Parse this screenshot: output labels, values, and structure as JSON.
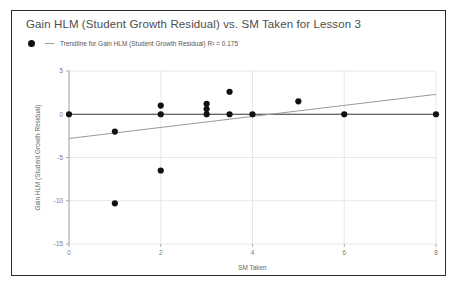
{
  "chart_data": {
    "type": "scatter",
    "title": "Gain HLM (Student Growth Residual) vs. SM Taken for Lesson 3",
    "xlabel": "SM Taken",
    "ylabel": "Gain HLM (Student Growth Residual)",
    "xlim": [
      0,
      8
    ],
    "ylim": [
      -15,
      5
    ],
    "xticks": [
      0,
      2,
      4,
      6,
      8
    ],
    "yticks": [
      5,
      0,
      -5,
      -10,
      -15
    ],
    "xtick_labels": [
      "0",
      "2",
      "4",
      "6",
      "8"
    ],
    "ytick_labels": [
      "5",
      "0",
      "-5",
      "-10",
      "-15"
    ],
    "grid": true,
    "legend_position": "top-left",
    "legend": [
      {
        "marker": "circle",
        "line": "trendline",
        "label": "Trendline for Gain HLM (Student Growth Residual) R² = 0.175"
      }
    ],
    "series": [
      {
        "name": "Gain HLM (Student Growth Residual)",
        "marker": "circle",
        "color": "#111111",
        "points": [
          {
            "x": 0,
            "y": 0
          },
          {
            "x": 1,
            "y": -2.0
          },
          {
            "x": 1,
            "y": -10.3
          },
          {
            "x": 2,
            "y": 1.0
          },
          {
            "x": 2,
            "y": 0.0
          },
          {
            "x": 2,
            "y": -6.5
          },
          {
            "x": 3,
            "y": 1.2
          },
          {
            "x": 3,
            "y": 0.6
          },
          {
            "x": 3,
            "y": 0.0
          },
          {
            "x": 3.5,
            "y": 2.6
          },
          {
            "x": 3.5,
            "y": 0.0
          },
          {
            "x": 4,
            "y": 0.0
          },
          {
            "x": 5,
            "y": 1.5
          },
          {
            "x": 6,
            "y": 0.0
          },
          {
            "x": 8,
            "y": 0.0
          }
        ]
      }
    ],
    "trendline": {
      "name": "Trendline",
      "color": "#9a9a9a",
      "r_squared": 0.175,
      "x_start": 0,
      "y_start": -2.8,
      "x_end": 8,
      "y_end": 2.3
    },
    "zero_line": {
      "y": 0,
      "color": "#3a3a3a"
    }
  }
}
